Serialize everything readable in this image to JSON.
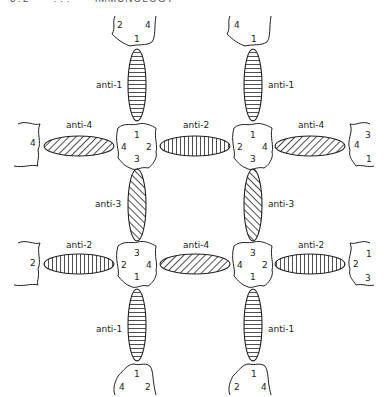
{
  "header": {
    "text": "3?2      ???      IMMUNOLOGY"
  },
  "diagram": {
    "antibody_labels": {
      "top_left_vertical": "anti-1",
      "top_right_vertical": "anti-1",
      "mid_left_horizontal": "anti-4",
      "mid_center_horizontal": "anti-2",
      "mid_right_horizontal": "anti-4",
      "center_left_vertical": "anti-3",
      "center_right_vertical": "anti-3",
      "lower_left_horizontal": "anti-2",
      "lower_center_horizontal": "anti-4",
      "lower_right_horizontal": "anti-2",
      "bottom_left_vertical": "anti-1",
      "bottom_right_vertical": "anti-1"
    },
    "antigen_nodes": {
      "node_tl": {
        "top": "1",
        "left": "4",
        "right": "2",
        "bottom": "3"
      },
      "node_tr": {
        "top": "1",
        "left": "2",
        "right": "4",
        "bottom": "3"
      },
      "node_bl": {
        "top": "3",
        "left": "2",
        "right": "4",
        "bottom": "1"
      },
      "node_br": {
        "top": "3",
        "left": "4",
        "right": "2",
        "bottom": "1"
      }
    },
    "edge_fragments": {
      "top_left": {
        "a": "2",
        "b": "4",
        "c": "1"
      },
      "top_right": {
        "a": "4",
        "c": "1"
      },
      "left_mid": {
        "a": "4"
      },
      "left_low": {
        "a": "2"
      },
      "right_mid": {
        "a": "3",
        "b": "4",
        "c": "1"
      },
      "right_low": {
        "a": "1",
        "b": "2",
        "c": "3"
      },
      "bottom_left": {
        "a": "1",
        "b": "4",
        "c": "2"
      },
      "bottom_right": {
        "a": "1",
        "b": "2",
        "c": "4"
      }
    }
  }
}
